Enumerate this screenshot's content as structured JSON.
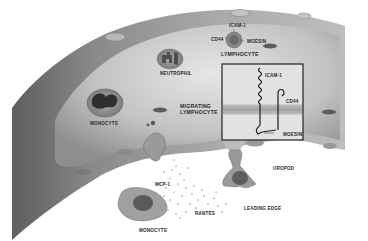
{
  "diagram": {
    "labels": {
      "icam1_top": "ICAM-1",
      "cd44_top": "CD44",
      "moesin_top": "MOESIN",
      "lymphocyte": "LYMPHOCYTE",
      "neutrophil": "NEUTROPHIL",
      "monocyte_vessel": "MONOCYTE",
      "migrating_line1": "MIGRATING",
      "migrating_line2": "LYMPHOCYTE",
      "icam1_inset": "ICAM-1",
      "cd44_inset": "CD44",
      "moesin_inset": "MOESIN",
      "uropod": "UROPOD",
      "mcp1": "MCP-1",
      "rantes": "RANTES",
      "leading_edge": "LEADING EDGE",
      "monocyte_tissue": "MONOCYTE"
    },
    "colors": {
      "vessel_dark": "#5a5a5a",
      "vessel_mid": "#9a9a9a",
      "vessel_light": "#d8d8d8",
      "cell_body": "#8c8c8c",
      "nucleus": "#4a4a4a",
      "inset_border": "#222222",
      "background": "#ffffff"
    }
  }
}
